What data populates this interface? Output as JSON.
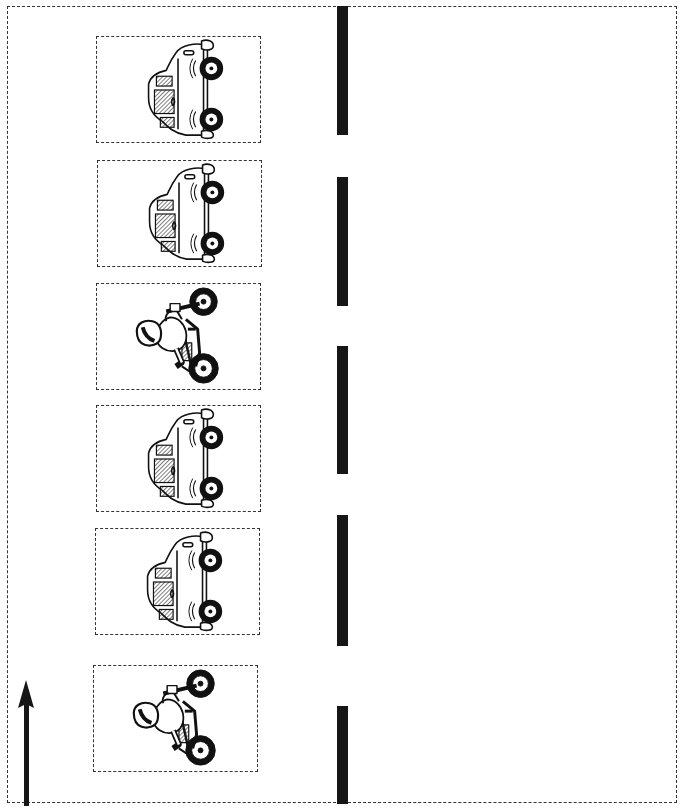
{
  "scene": {
    "description": "Road lane worksheet with vehicles in dashed boxes",
    "colors": {
      "ink": "#161616",
      "border": "#333333",
      "paper": "#ffffff"
    },
    "direction_arrow": {
      "icon": "arrow-up-icon"
    },
    "lane_dashes": [
      {
        "top": 6,
        "height": 129
      },
      {
        "top": 177,
        "height": 129
      },
      {
        "top": 346,
        "height": 128
      },
      {
        "top": 515,
        "height": 131
      },
      {
        "top": 706,
        "height": 98
      }
    ],
    "vehicles": [
      {
        "type": "car",
        "icon": "car-icon"
      },
      {
        "type": "car",
        "icon": "car-icon"
      },
      {
        "type": "motorcycle",
        "icon": "motorcycle-icon"
      },
      {
        "type": "car",
        "icon": "car-icon"
      },
      {
        "type": "car",
        "icon": "car-icon"
      },
      {
        "type": "motorcycle",
        "icon": "motorcycle-icon"
      }
    ]
  }
}
